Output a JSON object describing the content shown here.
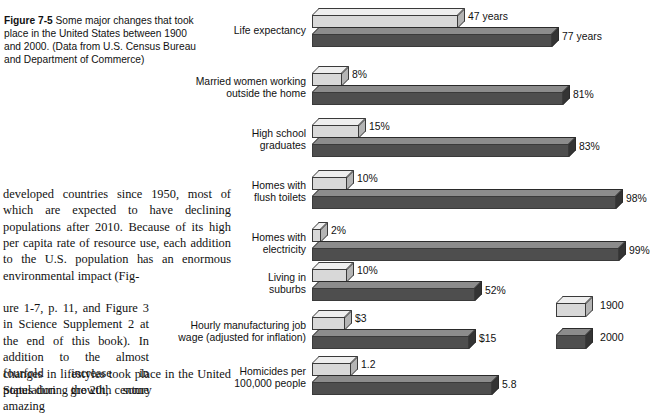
{
  "figure": {
    "caption_label": "Figure 7-5",
    "caption_text": " Some major changes that took place in the United States between 1900 and 2000. (Data from U.S. Census Bureau and Department of Commerce)"
  },
  "body": {
    "para_a": "developed countries since 1950, most of which are expected to have declining populations after 2010. Because of its high per capita rate of resource use, each addition to the U.S. population has an enormous environmental impact (Fig-",
    "para_b": "ure 1-7, p. 11, and Figure 3 in Science Supplement 2 at the end of this book). In addition to the almost fourfold increase in population growth, some amazing",
    "para_c": "changes in lifestyles took place in the United States during the 20th century"
  },
  "legend": {
    "items": [
      {
        "label": "1900",
        "color": "#d8d8d8"
      },
      {
        "label": "2000",
        "color": "#4e4e4e"
      }
    ]
  },
  "chart_data": {
    "type": "bar",
    "title": "Some major changes that took place in the United States between 1900 and 2000",
    "orientation": "horizontal",
    "grouped": true,
    "legend_position": "right",
    "grid": false,
    "xlabel": "",
    "ylabel": "",
    "series": [
      {
        "name": "1900",
        "color": "#d8d8d8"
      },
      {
        "name": "2000",
        "color": "#4e4e4e"
      }
    ],
    "categories": [
      "Life expectancy",
      "Married women working\noutside the home",
      "High school\ngraduates",
      "Homes with\nflush toilets",
      "Homes with\nelectricity",
      "Living in\nsuburbs",
      "Hourly manufacturing job\nwage (adjusted for inflation)",
      "Homicides per\n100,000 people"
    ],
    "rows": [
      {
        "category": "Life expectancy",
        "label_line1": "Life expectancy",
        "label_line2": "",
        "v1900": 47,
        "v1900_label": "47 years",
        "v1900_px": 146,
        "v2000": 77,
        "v2000_label": "77 years",
        "v2000_px": 240
      },
      {
        "category": "Married women working outside the home",
        "label_line1": "Married women working",
        "label_line2": "outside the home",
        "v1900": 8,
        "v1900_label": "8%",
        "v1900_px": 30,
        "v2000": 81,
        "v2000_label": "81%",
        "v2000_px": 251
      },
      {
        "category": "High school graduates",
        "label_line1": "High school",
        "label_line2": "graduates",
        "v1900": 15,
        "v1900_label": "15%",
        "v1900_px": 47,
        "v2000": 83,
        "v2000_label": "83%",
        "v2000_px": 257
      },
      {
        "category": "Homes with flush toilets",
        "label_line1": "Homes with",
        "label_line2": "flush toilets",
        "v1900": 10,
        "v1900_label": "10%",
        "v1900_px": 35,
        "v2000": 98,
        "v2000_label": "98%",
        "v2000_px": 304
      },
      {
        "category": "Homes with electricity",
        "label_line1": "Homes with",
        "label_line2": "electricity",
        "v1900": 2,
        "v1900_label": "2%",
        "v1900_px": 9,
        "v2000": 99,
        "v2000_label": "99%",
        "v2000_px": 307
      },
      {
        "category": "Living in suburbs",
        "label_line1": "Living in",
        "label_line2": "suburbs",
        "v1900": 10,
        "v1900_label": "10%",
        "v1900_px": 35,
        "v2000": 52,
        "v2000_label": "52%",
        "v2000_px": 163
      },
      {
        "category": "Hourly manufacturing job wage (adjusted for inflation)",
        "label_line1": "Hourly manufacturing job",
        "label_line2": "wage (adjusted for inflation)",
        "v1900": 3,
        "v1900_label": "$3",
        "v1900_px": 33,
        "v2000": 15,
        "v2000_label": "$15",
        "v2000_px": 157
      },
      {
        "category": "Homicides per 100,000 people",
        "label_line1": "Homicides per",
        "label_line2": "100,000 people",
        "v1900": 1.2,
        "v1900_label": "1.2",
        "v1900_px": 39,
        "v2000": 5.8,
        "v2000_label": "5.8",
        "v2000_px": 180
      }
    ],
    "units": {
      "Life expectancy": "years",
      "Married women working outside the home": "%",
      "High school graduates": "%",
      "Homes with flush toilets": "%",
      "Homes with electricity": "%",
      "Living in suburbs": "%",
      "Hourly manufacturing job wage (adjusted for inflation)": "US dollars per hour",
      "Homicides per 100,000 people": "per 100,000 people"
    }
  },
  "layout": {
    "bar_origin_x": 312,
    "group_tops": [
      8,
      66,
      118,
      170,
      222,
      262,
      310,
      356
    ],
    "value_offset_x": 10
  }
}
